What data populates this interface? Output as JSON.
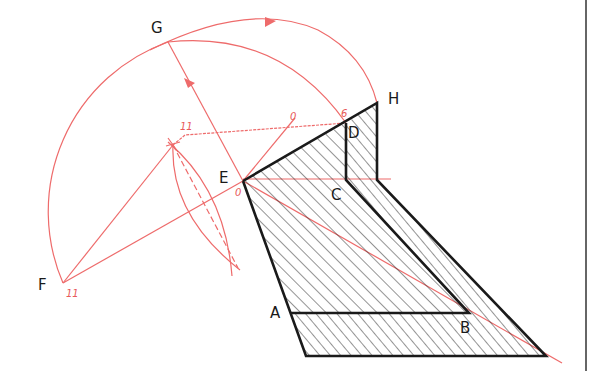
{
  "diagram": {
    "type": "geometric construction",
    "colors": {
      "construction": "#ee6b6b",
      "outline": "#1a1a1a",
      "hatch": "#2a2a2a",
      "background": "#ffffff"
    },
    "labels": {
      "G": "G",
      "H": "H",
      "D": "D",
      "E": "E",
      "C": "C",
      "A": "A",
      "B": "B",
      "F": "F"
    },
    "marks": {
      "eleven_top": "11",
      "eleven_F": "11",
      "zero_top": "0",
      "zero_E": "0",
      "six_D": "6"
    }
  }
}
